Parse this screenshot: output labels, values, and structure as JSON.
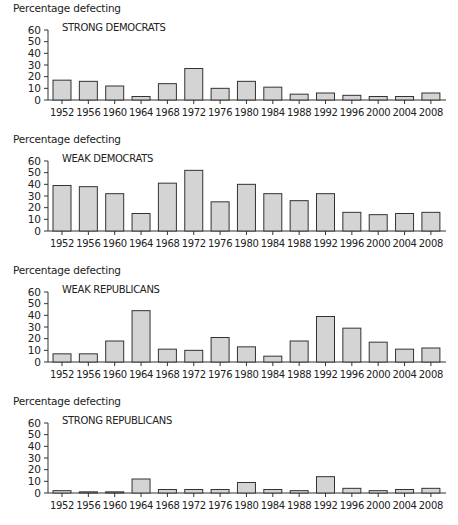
{
  "chart_data": [
    {
      "type": "bar",
      "title": "STRONG DEMOCRATS",
      "xlabel": "",
      "ylabel": "Percentage defecting",
      "ylim": [
        0,
        60
      ],
      "yticks": [
        0,
        10,
        20,
        30,
        40,
        50,
        60
      ],
      "grid": false,
      "categories": [
        "1952",
        "1956",
        "1960",
        "1964",
        "1968",
        "1972",
        "1976",
        "1980",
        "1984",
        "1988",
        "1992",
        "1996",
        "2000",
        "2004",
        "2008"
      ],
      "values": [
        17,
        16,
        12,
        3,
        14,
        27,
        10,
        16,
        11,
        5,
        6,
        4,
        3,
        3,
        6
      ],
      "bar_color": "#d4d4d4"
    },
    {
      "type": "bar",
      "title": "WEAK DEMOCRATS",
      "xlabel": "",
      "ylabel": "Percentage defecting",
      "ylim": [
        0,
        60
      ],
      "yticks": [
        0,
        10,
        20,
        30,
        40,
        50,
        60
      ],
      "grid": false,
      "categories": [
        "1952",
        "1956",
        "1960",
        "1964",
        "1968",
        "1972",
        "1976",
        "1980",
        "1984",
        "1988",
        "1992",
        "1996",
        "2000",
        "2004",
        "2008"
      ],
      "values": [
        39,
        38,
        32,
        15,
        41,
        52,
        25,
        40,
        32,
        26,
        32,
        16,
        14,
        15,
        16
      ],
      "bar_color": "#d4d4d4"
    },
    {
      "type": "bar",
      "title": "WEAK REPUBLICANS",
      "xlabel": "",
      "ylabel": "Percentage defecting",
      "ylim": [
        0,
        60
      ],
      "yticks": [
        0,
        10,
        20,
        30,
        40,
        50,
        60
      ],
      "grid": false,
      "categories": [
        "1952",
        "1956",
        "1960",
        "1964",
        "1968",
        "1972",
        "1976",
        "1980",
        "1984",
        "1988",
        "1992",
        "1996",
        "2000",
        "2004",
        "2008"
      ],
      "values": [
        7,
        7,
        18,
        44,
        11,
        10,
        21,
        13,
        5,
        18,
        39,
        29,
        17,
        11,
        12
      ],
      "bar_color": "#d4d4d4"
    },
    {
      "type": "bar",
      "title": "STRONG REPUBLICANS",
      "xlabel": "",
      "ylabel": "Percentage defecting",
      "ylim": [
        0,
        60
      ],
      "yticks": [
        0,
        10,
        20,
        30,
        40,
        50,
        60
      ],
      "grid": false,
      "categories": [
        "1952",
        "1956",
        "1960",
        "1964",
        "1968",
        "1972",
        "1976",
        "1980",
        "1984",
        "1988",
        "1992",
        "1996",
        "2000",
        "2004",
        "2008"
      ],
      "values": [
        2,
        1,
        1,
        12,
        3,
        3,
        3,
        9,
        3,
        2,
        14,
        4,
        2,
        3,
        4
      ],
      "bar_color": "#d4d4d4"
    }
  ],
  "panels": [
    {
      "ylabel": "Percentage defecting",
      "subtitle": "STRONG DEMOCRATS"
    },
    {
      "ylabel": "Percentage defecting",
      "subtitle": "WEAK DEMOCRATS"
    },
    {
      "ylabel": "Percentage defecting",
      "subtitle": "WEAK REPUBLICANS"
    },
    {
      "ylabel": "Percentage defecting",
      "subtitle": "STRONG REPUBLICANS"
    }
  ],
  "colors": {
    "bar_fill": "#d4d4d4",
    "bar_stroke": "#333333",
    "axis": "#333333",
    "text": "#222222"
  }
}
